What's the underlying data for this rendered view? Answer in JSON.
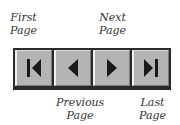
{
  "navigation": {
    "buttons": [
      {
        "id": "first",
        "label_line1": "First",
        "label_line2": "Page",
        "icon": "skip-first-icon"
      },
      {
        "id": "previous",
        "label_line1": "Previous",
        "label_line2": "Page",
        "icon": "triangle-left-icon"
      },
      {
        "id": "next",
        "label_line1": "Next",
        "label_line2": "Page",
        "icon": "triangle-right-icon"
      },
      {
        "id": "last",
        "label_line1": "Last",
        "label_line2": "Page",
        "icon": "skip-last-icon"
      }
    ]
  },
  "colors": {
    "button_face": "#b4b4b4",
    "bar_frame": "#2a2a2a",
    "icon": "#1a1a1a",
    "label_text": "#333333"
  }
}
